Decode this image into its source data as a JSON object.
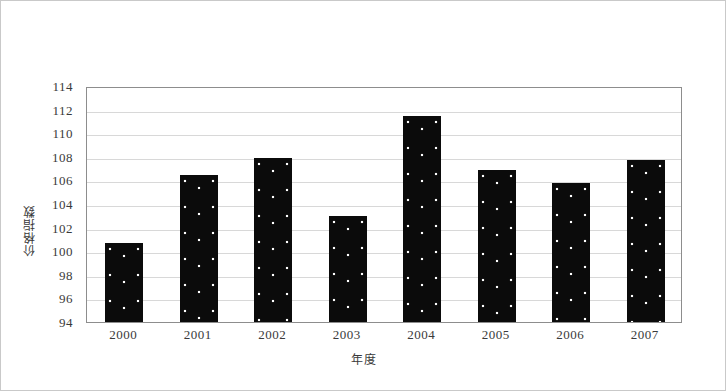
{
  "chart_data": {
    "type": "bar",
    "title": "",
    "subtitle": "",
    "xlabel": "年度",
    "ylabel": "价格指数",
    "categories": [
      "2000",
      "2001",
      "2002",
      "2003",
      "2004",
      "2005",
      "2006",
      "2007"
    ],
    "values": [
      100.7,
      106.5,
      107.9,
      103.0,
      111.5,
      106.9,
      105.8,
      107.7
    ],
    "series": [
      {
        "name": "价格指数",
        "values": [
          100.7,
          106.5,
          107.9,
          103.0,
          111.5,
          106.9,
          105.8,
          107.7
        ]
      }
    ],
    "ylim": [
      94,
      114
    ],
    "ytick_labels": [
      "114",
      "112",
      "110",
      "108",
      "106",
      "104",
      "102",
      "100",
      "98",
      "96",
      "94"
    ],
    "ytick_values": [
      114,
      112,
      110,
      108,
      106,
      104,
      102,
      100,
      98,
      96,
      94
    ],
    "grid": true,
    "grid_axis": "y",
    "legend": false,
    "legend_position": "none",
    "bar_fill": "#0b0b0b",
    "bar_pattern": "white-dotted",
    "frame_color": "#8d8d8d",
    "gridline_color": "#d8d8d8",
    "annotations": []
  },
  "figure": {
    "border_color": "#c9c9c9",
    "background": "#ffffff"
  }
}
